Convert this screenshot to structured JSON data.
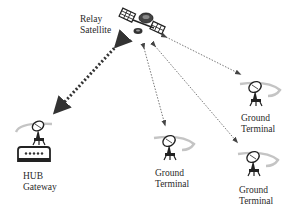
{
  "diagram": {
    "type": "satellite-network-topology",
    "nodes": [
      {
        "id": "relay-satellite",
        "label_line1": "Relay",
        "label_line2": "Satellite",
        "icon": "satellite-icon"
      },
      {
        "id": "hub-gateway",
        "label_line1": "HUB",
        "label_line2": "Gateway",
        "icon": "dish-antenna-icon"
      },
      {
        "id": "ground-terminal-1",
        "label_line1": "Ground",
        "label_line2": "Terminal",
        "icon": "dish-antenna-icon"
      },
      {
        "id": "ground-terminal-2",
        "label_line1": "Ground",
        "label_line2": "Terminal",
        "icon": "dish-antenna-icon"
      },
      {
        "id": "ground-terminal-3",
        "label_line1": "Ground",
        "label_line2": "Terminal",
        "icon": "dish-antenna-icon"
      }
    ],
    "links": [
      {
        "from": "relay-satellite",
        "to": "hub-gateway",
        "style": "thick-dotted",
        "bidirectional": true
      },
      {
        "from": "relay-satellite",
        "to": "ground-terminal-1",
        "style": "thin-dotted",
        "bidirectional": true
      },
      {
        "from": "relay-satellite",
        "to": "ground-terminal-2",
        "style": "thin-dotted",
        "bidirectional": true
      },
      {
        "from": "relay-satellite",
        "to": "ground-terminal-3",
        "style": "thin-dotted",
        "bidirectional": true
      }
    ]
  },
  "colors": {
    "background": "#ffffff",
    "line": "#555555",
    "icon": "#222222",
    "swoosh": "#bbbbbb"
  }
}
